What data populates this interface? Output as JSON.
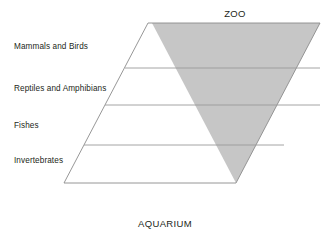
{
  "diagram": {
    "type": "inverted-pyramid-parallelogram",
    "top_label": "ZOO",
    "bottom_label": "AQUARIUM",
    "tiers": [
      {
        "label": "Mammals and Birds"
      },
      {
        "label": "Reptiles and Amphibians"
      },
      {
        "label": "Fishes"
      },
      {
        "label": "Invertebrates"
      }
    ],
    "colors": {
      "background": "#ffffff",
      "shaded_fill": "#c6c6c6",
      "outline": "#8b8b8b",
      "divider": "#9a9a9a",
      "text": "#231f20"
    },
    "geometry": {
      "parallelogram": "148,23 320,23 236,183 64,183",
      "shaded_triangle": "152,23 320,23 236,183",
      "dividers": [
        "125,68 320,68",
        "105,105 320,105",
        "84,145 284,145"
      ]
    }
  }
}
